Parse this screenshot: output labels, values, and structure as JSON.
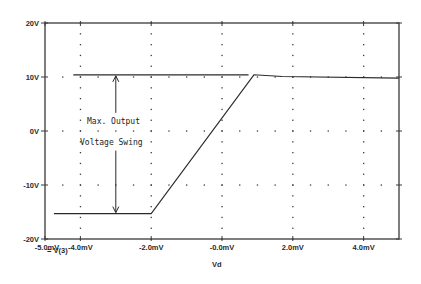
{
  "chart_data": {
    "type": "line",
    "title": "",
    "xlabel": "Vd",
    "ylabel": "",
    "xlim": [
      -5.0,
      5.0
    ],
    "ylim": [
      -20,
      20
    ],
    "x_unit": "mV",
    "y_unit": "V",
    "x_ticks": [
      -5.0,
      -4.0,
      -2.0,
      0.0,
      2.0,
      4.0
    ],
    "x_tick_labels": [
      "-5.0mV",
      "-4.0mV",
      "-2.0mV",
      "-0.0mV",
      "2.0mV",
      "4.0mV"
    ],
    "y_ticks": [
      20,
      10,
      0,
      -10,
      -20
    ],
    "y_tick_labels": [
      "20V",
      "10V",
      "0V",
      "-10V",
      "-20V"
    ],
    "grid": "dotted",
    "legend": [
      {
        "marker": "square",
        "label": "V(3)"
      }
    ],
    "series": [
      {
        "name": "V(3)",
        "x": [
          -4.75,
          -2.0,
          0.9,
          1.7,
          5.0
        ],
        "y": [
          -15.3,
          -15.3,
          10.4,
          10.1,
          9.8
        ]
      }
    ],
    "annotations": [
      {
        "type": "hline",
        "y": 10.4,
        "x_from": -4.2,
        "x_to": 0.75,
        "label": ""
      },
      {
        "type": "double-arrow",
        "x": -3.0,
        "y_from": 10.4,
        "y_to": -15.3
      },
      {
        "type": "text",
        "lines": [
          "Max. Output",
          "Voltage Swing"
        ],
        "x": -4.0,
        "y": 1.5
      }
    ]
  },
  "labels": {
    "legend_text": "= V(3)",
    "annotation_line1": "Max. Output",
    "annotation_line2": "Voltage Swing",
    "xlabel": "Vd"
  },
  "colors": {
    "axis": "#3a3a3a",
    "trace": "#2a2a2a",
    "grid_dot": "#3a3a3a",
    "background": "#ffffff"
  }
}
